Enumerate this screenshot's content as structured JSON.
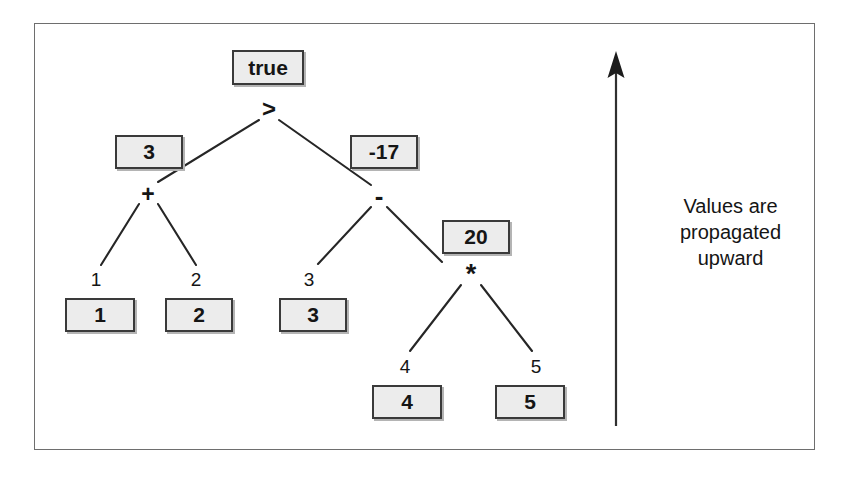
{
  "figure": {
    "kind": "expression-tree",
    "caption_lines": [
      "Values are",
      "propagated",
      "upward"
    ],
    "frame_color": "#6e6e6e",
    "box_fill": "#ececec",
    "box_border": "#3a3a3a",
    "ink_color": "#151515"
  },
  "nodes": {
    "root_op": ">",
    "left_op": "+",
    "right_op": "-",
    "mul_op": "*"
  },
  "value_boxes": {
    "root": "true",
    "left_sum": "3",
    "right_diff": "-17",
    "product": "20",
    "leaf1": "1",
    "leaf2": "2",
    "leaf3": "3",
    "leaf4": "4",
    "leaf5": "5"
  },
  "edge_labels": {
    "e1": "1",
    "e2": "2",
    "e3": "3",
    "e4": "4",
    "e5": "5"
  },
  "arrow": {
    "label": "upward-propagation-arrow",
    "direction": "up"
  }
}
